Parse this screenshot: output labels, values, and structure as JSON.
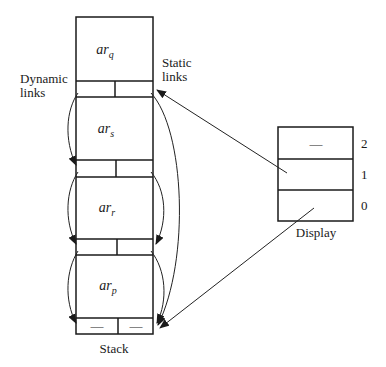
{
  "diagram": {
    "stack": {
      "label": "Stack",
      "frames": [
        {
          "name": "ar",
          "sub": "q"
        },
        {
          "name": "ar",
          "sub": "s"
        },
        {
          "name": "ar",
          "sub": "r"
        },
        {
          "name": "ar",
          "sub": "p"
        }
      ],
      "bottom_link_values": [
        "—",
        "—"
      ]
    },
    "labels": {
      "dynamic_line1": "Dynamic",
      "dynamic_line2": "links",
      "static_line1": "Static",
      "static_line2": "links"
    },
    "display": {
      "label": "Display",
      "rows": [
        {
          "index": "2",
          "value": "—"
        },
        {
          "index": "1",
          "value": ""
        },
        {
          "index": "0",
          "value": ""
        }
      ]
    }
  }
}
